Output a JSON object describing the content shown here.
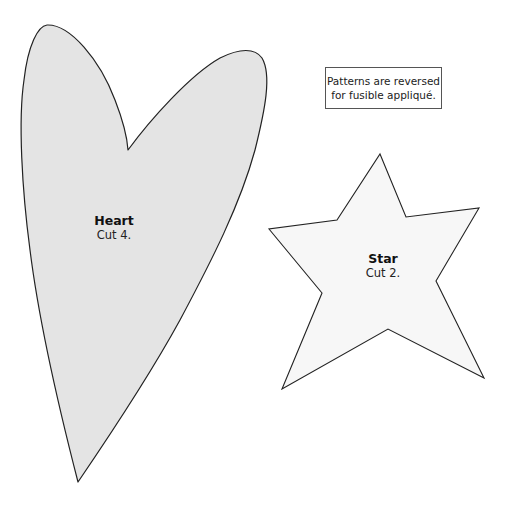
{
  "note": {
    "line1": "Patterns are reversed",
    "line2": "for fusible appliqué."
  },
  "shapes": {
    "heart": {
      "title": "Heart",
      "instruction": "Cut 4.",
      "fill": "#e4e4e4",
      "stroke": "#222222"
    },
    "star": {
      "title": "Star",
      "instruction": "Cut 2.",
      "fill": "#f7f7f7",
      "stroke": "#222222"
    }
  }
}
